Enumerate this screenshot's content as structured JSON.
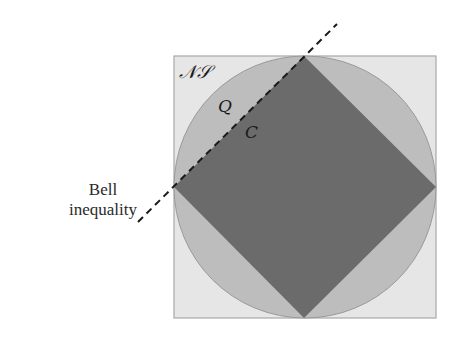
{
  "diagram": {
    "regions": [
      {
        "id": "no-signaling",
        "label": "𝒩𝒮",
        "shape": "square",
        "fill": "#e6e6e6"
      },
      {
        "id": "quantum",
        "label": "Q",
        "shape": "circle",
        "fill": "#bdbdbd"
      },
      {
        "id": "classical",
        "label": "C",
        "shape": "diamond",
        "fill": "#6b6b6b"
      }
    ],
    "labels": {
      "ns": "𝒩𝒮",
      "q": "Q",
      "c": "C",
      "bell_line1": "Bell",
      "bell_line2": "inequality"
    },
    "colors": {
      "square_fill": "#e6e6e6",
      "square_stroke": "#a8a8a8",
      "circle_fill": "#bdbdbd",
      "circle_stroke": "#9a9a9a",
      "diamond_fill": "#6b6b6b",
      "dash_line": "#1a1a1a"
    }
  }
}
